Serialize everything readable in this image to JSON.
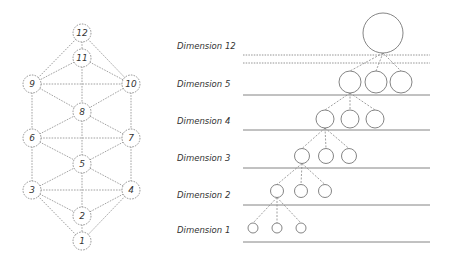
{
  "left_graph": {
    "nodes": [
      {
        "id": "12",
        "label": "12"
      },
      {
        "id": "11",
        "label": "11"
      },
      {
        "id": "9",
        "label": "9"
      },
      {
        "id": "10",
        "label": "10"
      },
      {
        "id": "8",
        "label": "8"
      },
      {
        "id": "6",
        "label": "6"
      },
      {
        "id": "7",
        "label": "7"
      },
      {
        "id": "5",
        "label": "5"
      },
      {
        "id": "3",
        "label": "3"
      },
      {
        "id": "4",
        "label": "4"
      },
      {
        "id": "2",
        "label": "2"
      },
      {
        "id": "1",
        "label": "1"
      }
    ],
    "edges": [
      [
        "12",
        "9"
      ],
      [
        "12",
        "10"
      ],
      [
        "12",
        "11"
      ],
      [
        "11",
        "9"
      ],
      [
        "11",
        "10"
      ],
      [
        "11",
        "8"
      ],
      [
        "9",
        "10"
      ],
      [
        "9",
        "8"
      ],
      [
        "10",
        "8"
      ],
      [
        "9",
        "6"
      ],
      [
        "10",
        "7"
      ],
      [
        "6",
        "8"
      ],
      [
        "7",
        "8"
      ],
      [
        "6",
        "7"
      ],
      [
        "8",
        "5"
      ],
      [
        "6",
        "5"
      ],
      [
        "7",
        "5"
      ],
      [
        "6",
        "3"
      ],
      [
        "7",
        "4"
      ],
      [
        "3",
        "5"
      ],
      [
        "4",
        "5"
      ],
      [
        "3",
        "4"
      ],
      [
        "5",
        "2"
      ],
      [
        "3",
        "2"
      ],
      [
        "4",
        "2"
      ],
      [
        "2",
        "1"
      ],
      [
        "3",
        "1"
      ],
      [
        "4",
        "1"
      ]
    ]
  },
  "right_diagram": {
    "dimensions": [
      {
        "label": "Dimension 12",
        "circles": 1
      },
      {
        "label": "Dimension 5",
        "circles": 3
      },
      {
        "label": "Dimension 4",
        "circles": 3
      },
      {
        "label": "Dimension 3",
        "circles": 3
      },
      {
        "label": "Dimension 2",
        "circles": 3
      },
      {
        "label": "Dimension 1",
        "circles": 3
      }
    ]
  }
}
